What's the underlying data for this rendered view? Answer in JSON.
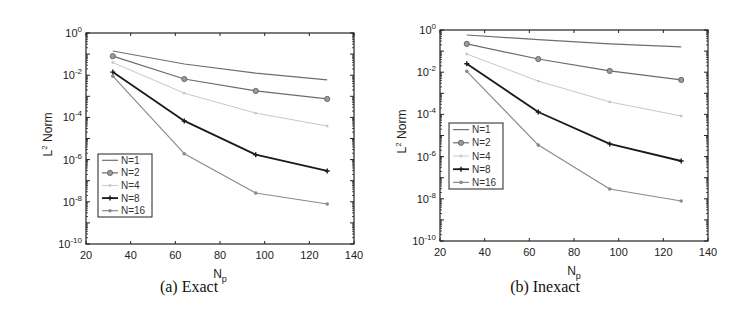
{
  "chart_data": [
    {
      "type": "line",
      "caption": "(a) Exact",
      "title": "",
      "xlabel": "N_p",
      "ylabel": "L^2 Norm",
      "yscale": "log",
      "xlim": [
        20,
        140
      ],
      "ylim": [
        1e-10,
        1
      ],
      "xticks": [
        20,
        40,
        60,
        80,
        100,
        120,
        140
      ],
      "yticks": [
        "10^0",
        "10^-2",
        "10^-4",
        "10^-6",
        "10^-8",
        "10^-10"
      ],
      "grid": false,
      "legend_position": "lower left",
      "x": [
        32,
        64,
        96,
        128
      ],
      "series": [
        {
          "name": "N=1",
          "marker": "none",
          "color": "#6e6e6e",
          "width": 1.2,
          "values": [
            0.14,
            0.034,
            0.0126,
            0.006
          ]
        },
        {
          "name": "N=2",
          "marker": "circle",
          "color": "#6b6b6b",
          "width": 1.2,
          "values": [
            0.08,
            0.0066,
            0.0018,
            0.00075
          ]
        },
        {
          "name": "N=4",
          "marker": "dot",
          "color": "#c8c8c8",
          "width": 1.0,
          "values": [
            0.04,
            0.0014,
            0.00016,
            3.9e-05
          ]
        },
        {
          "name": "N=8",
          "marker": "plus",
          "color": "#1a1a1a",
          "width": 1.8,
          "values": [
            0.014,
            6.8e-05,
            1.7e-06,
            2.9e-07
          ]
        },
        {
          "name": "N=16",
          "marker": "star",
          "color": "#8a8a8a",
          "width": 1.2,
          "values": [
            0.009,
            1.9e-06,
            2.6e-08,
            7.9e-09
          ]
        }
      ]
    },
    {
      "type": "line",
      "caption": "(b) Inexact",
      "title": "",
      "xlabel": "N_p",
      "ylabel": "L^2 Norm",
      "yscale": "log",
      "xlim": [
        20,
        140
      ],
      "ylim": [
        1e-10,
        1
      ],
      "xticks": [
        20,
        40,
        60,
        80,
        100,
        120,
        140
      ],
      "yticks": [
        "10^0",
        "10^-2",
        "10^-4",
        "10^-6",
        "10^-8",
        "10^-10"
      ],
      "grid": false,
      "legend_position": "center left",
      "x": [
        32,
        64,
        96,
        128
      ],
      "series": [
        {
          "name": "N=1",
          "marker": "none",
          "color": "#6e6e6e",
          "width": 1.2,
          "values": [
            0.58,
            0.35,
            0.22,
            0.16
          ]
        },
        {
          "name": "N=2",
          "marker": "circle",
          "color": "#6b6b6b",
          "width": 1.2,
          "values": [
            0.22,
            0.042,
            0.0115,
            0.0043
          ]
        },
        {
          "name": "N=4",
          "marker": "dot",
          "color": "#c8c8c8",
          "width": 1.0,
          "values": [
            0.073,
            0.0038,
            0.00039,
            8.4e-05
          ]
        },
        {
          "name": "N=8",
          "marker": "plus",
          "color": "#1a1a1a",
          "width": 1.8,
          "values": [
            0.025,
            0.00013,
            4e-06,
            6.2e-07
          ]
        },
        {
          "name": "N=16",
          "marker": "star",
          "color": "#8a8a8a",
          "width": 1.2,
          "values": [
            0.011,
            3.5e-06,
            2.9e-08,
            7.9e-09
          ]
        }
      ]
    }
  ],
  "layout": [
    {
      "plot": {
        "left": 86,
        "top": 33,
        "right": 354,
        "bottom": 244
      },
      "legend": {
        "left": 98,
        "top": 154,
        "width": 54,
        "height": 63
      },
      "caption_x": 189,
      "caption_y": 290
    },
    {
      "plot": {
        "left": 440,
        "top": 30,
        "right": 708,
        "bottom": 241
      },
      "legend": {
        "left": 449,
        "top": 123,
        "width": 54,
        "height": 66
      },
      "caption_x": 545,
      "caption_y": 290
    }
  ]
}
